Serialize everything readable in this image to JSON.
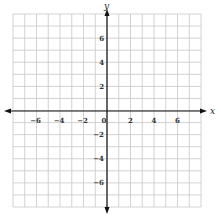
{
  "chart_data": {
    "type": "scatter",
    "title": "",
    "xlabel": "x",
    "ylabel": "y",
    "xlim": [
      -8,
      8
    ],
    "ylim": [
      -8,
      8
    ],
    "grid": true,
    "grid_step": 1,
    "x_ticks": [
      -6,
      -4,
      -2,
      0,
      2,
      4,
      6
    ],
    "y_ticks": [
      6,
      4,
      2,
      -2,
      -4,
      -6
    ],
    "x_tick_labels": [
      "−6",
      "−4",
      "−2",
      "0",
      "2",
      "4",
      "6"
    ],
    "y_tick_labels": [
      "6",
      "4",
      "2",
      "−2",
      "−4",
      "−6"
    ],
    "series": [],
    "colors": {
      "grid": "#c8c8c8",
      "axis": "#111111",
      "text": "#333333"
    }
  }
}
